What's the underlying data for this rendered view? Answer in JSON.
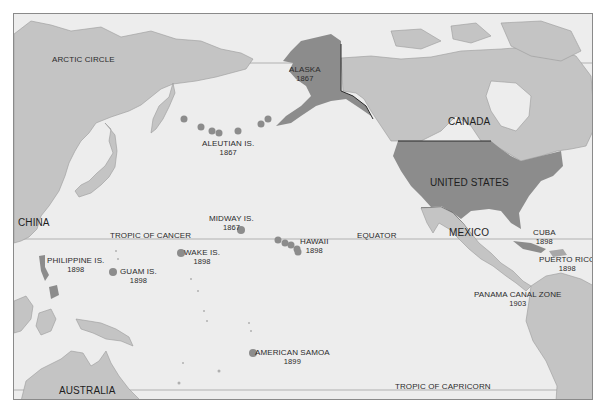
{
  "map": {
    "colors": {
      "ocean": "#ededed",
      "land": "#c4c4c4",
      "us_territory": "#8c8c8c",
      "coastline": "#9a9a9a",
      "border": "#2a2a2a",
      "latitude_line": "#9a9a9a",
      "island_marker": "#8c8c8c",
      "text": "#2b2b2b"
    },
    "reference_lines": {
      "arctic_circle": "ARCTIC CIRCLE",
      "tropic_of_cancer": "TROPIC OF CANCER",
      "equator": "EQUATOR",
      "tropic_of_capricorn": "TROPIC OF CAPRICORN"
    },
    "countries": {
      "china": "CHINA",
      "australia": "AUSTRALIA",
      "canada": "CANADA",
      "mexico": "MEXICO",
      "united_states": "UNITED STATES"
    },
    "territories": {
      "alaska": {
        "name": "ALASKA",
        "year": "1867"
      },
      "aleutian": {
        "name": "ALEUTIAN IS.",
        "year": "1867"
      },
      "midway": {
        "name": "MIDWAY IS.",
        "year": "1867"
      },
      "hawaii": {
        "name": "HAWAII",
        "year": "1898"
      },
      "wake": {
        "name": "WAKE IS.",
        "year": "1898"
      },
      "guam": {
        "name": "GUAM IS.",
        "year": "1898"
      },
      "philippines": {
        "name": "PHILIPPINE IS.",
        "year": "1898"
      },
      "samoa": {
        "name": "AMERICAN SAMOA",
        "year": "1899"
      },
      "cuba": {
        "name": "CUBA",
        "year": "1898"
      },
      "puerto_rico": {
        "name": "PUERTO RICO",
        "year": "1898"
      },
      "panama": {
        "name": "PANAMA CANAL ZONE",
        "year": "1903"
      }
    }
  }
}
